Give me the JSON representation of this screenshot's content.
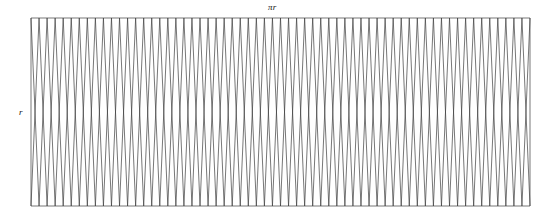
{
  "figure": {
    "labels": {
      "width_label": "πr",
      "height_label": "r"
    },
    "stroke_color": "#3c3c3c",
    "background_color": "#ffffff",
    "stroke_width": 0.7
  },
  "chart_data": {
    "type": "diagram",
    "title": "",
    "xlabel": "πr",
    "ylabel": "r",
    "geometry": {
      "x_left": 31,
      "x_right": 530,
      "y_top": 18,
      "y_bottom": 206,
      "rect_width": 499,
      "rect_height": 188,
      "sector_pairs": 31,
      "total_triangles": 62,
      "period_px": 16.0967741935,
      "top_vertices": 31,
      "bottom_vertices": 31
    },
    "axis_ranges": {
      "x": [
        0,
        499
      ],
      "y": [
        0,
        188
      ]
    },
    "grid": false,
    "legend": null
  }
}
